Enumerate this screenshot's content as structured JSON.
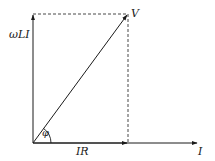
{
  "diagram": {
    "title": "",
    "type": "phasor-diagram",
    "labels": {
      "vertical_axis": "ωLI",
      "resultant": "V",
      "angle": "φ",
      "horizontal_component": "IR",
      "horizontal_axis": "I"
    },
    "colors": {
      "line": "#1a1a1a",
      "background": "#ffffff"
    }
  }
}
